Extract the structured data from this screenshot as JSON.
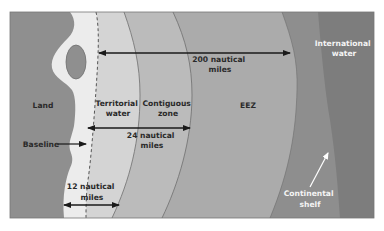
{
  "diagram": {
    "zones": [
      {
        "id": "land",
        "label": "Land",
        "color": "#8f8f8f"
      },
      {
        "id": "territorial",
        "label_lines": [
          "Territorial",
          "water"
        ],
        "color": "#d3d3d3"
      },
      {
        "id": "contiguous",
        "label_lines": [
          "Contiguous",
          "zone"
        ],
        "color": "#b9b9b9"
      },
      {
        "id": "eez",
        "label": "EEZ",
        "color": "#ababab"
      },
      {
        "id": "continental_shelf",
        "color": "#8c8c8c"
      },
      {
        "id": "international",
        "label_lines": [
          "International",
          "water"
        ],
        "color": "#7d7d7d"
      }
    ],
    "annotations": {
      "baseline": "Baseline",
      "nm12": [
        "12 nautical",
        "miles"
      ],
      "nm24": [
        "24 nautical",
        "miles"
      ],
      "nm200": [
        "200 nautical",
        "miles"
      ],
      "continental_shelf": [
        "Continental",
        "shelf"
      ]
    },
    "colors": {
      "coast_strip": "#ececec",
      "border": "#6e6e6e",
      "arrow": "#1a1a1a",
      "white_arrow": "#ffffff"
    }
  }
}
